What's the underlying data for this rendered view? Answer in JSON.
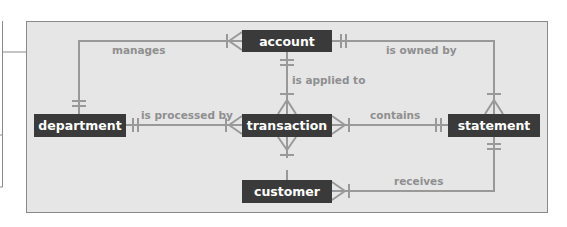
{
  "diagram": {
    "type": "entity-relationship",
    "colors": {
      "panel_fill": "#e6e6e6",
      "panel_border": "#8a8a8a",
      "entity_fill": "#3a3a3a",
      "entity_text": "#ffffff",
      "connector": "#999999",
      "relationship_text": "#8f8f8f"
    },
    "entities": [
      {
        "id": "account",
        "label": "account"
      },
      {
        "id": "department",
        "label": "department"
      },
      {
        "id": "transaction",
        "label": "transaction"
      },
      {
        "id": "statement",
        "label": "statement"
      },
      {
        "id": "customer",
        "label": "customer"
      }
    ],
    "relationships": [
      {
        "label": "manages",
        "from": "department",
        "to": "account",
        "from_cardinality": "one",
        "to_cardinality": "one-or-many"
      },
      {
        "label": "is owned by",
        "from": "account",
        "to": "statement",
        "from_cardinality": "one",
        "to_cardinality": "one-or-many"
      },
      {
        "label": "is applied to",
        "from": "account",
        "to": "transaction",
        "from_cardinality": "one",
        "to_cardinality": "one-or-many"
      },
      {
        "label": "is processed by",
        "from": "department",
        "to": "transaction",
        "from_cardinality": "one",
        "to_cardinality": "one-or-many"
      },
      {
        "label": "contains",
        "from": "statement",
        "to": "transaction",
        "from_cardinality": "one",
        "to_cardinality": "one-or-many"
      },
      {
        "label": "receives",
        "from": "statement",
        "to": "customer",
        "from_cardinality": "one",
        "to_cardinality": "one-or-many"
      },
      {
        "label": "",
        "from": "customer",
        "to": "transaction",
        "from_cardinality": "one",
        "to_cardinality": "one-or-many"
      }
    ]
  }
}
